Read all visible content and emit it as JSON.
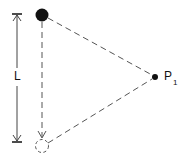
{
  "diagram": {
    "length_label": "L",
    "point_label": "P",
    "point_subscript": "1",
    "colors": {
      "ink": "#111111",
      "dashed": "#555555",
      "background": "#ffffff"
    },
    "elements": {
      "initial_mass": {
        "type": "solid-circle",
        "cx": 42,
        "cy": 15,
        "r": 6.5
      },
      "final_mass": {
        "type": "dashed-circle",
        "cx": 42,
        "cy": 146,
        "r": 6.5
      },
      "observation_point": {
        "type": "dot",
        "cx": 155,
        "cy": 77,
        "r": 3
      },
      "length_arrow": {
        "x": 17,
        "y1": 14,
        "y2": 142
      }
    }
  }
}
